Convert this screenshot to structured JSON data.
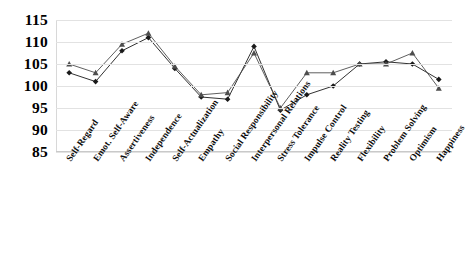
{
  "chart_data": {
    "type": "line",
    "title": "",
    "xlabel": "",
    "ylabel": "",
    "ylim": [
      85,
      115
    ],
    "ytick_step": 5,
    "yticks": [
      115,
      110,
      105,
      100,
      95,
      90,
      85
    ],
    "grid": true,
    "legend_position": "none",
    "categories": [
      "Self-Regard",
      "Emot. Self-Aware",
      "Assertiveness",
      "Independence",
      "Self-Actualization",
      "Empathy",
      "Social Responsibility",
      "Interpersonal Relations",
      "Stress Tolerance",
      "Impulse Control",
      "Reality Testing",
      "Flexibility",
      "Problem Solving",
      "Optimism",
      "Happiness"
    ],
    "series": [
      {
        "name": "Series 1",
        "marker": "diamond",
        "color": "#1a1a1a",
        "values": [
          103,
          101,
          108,
          111,
          104,
          97.5,
          97,
          109,
          94.5,
          98,
          100,
          105,
          105.5,
          105,
          101.5
        ]
      },
      {
        "name": "Series 2",
        "marker": "triangle",
        "color": "#4d4d4d",
        "values": [
          105,
          103,
          109.5,
          112,
          104.5,
          98,
          98.5,
          107.5,
          95,
          103,
          103,
          105,
          105,
          107.5,
          99.5
        ]
      }
    ]
  }
}
